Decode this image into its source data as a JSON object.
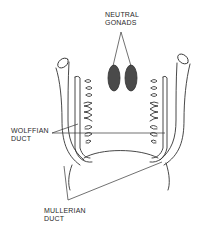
{
  "diagram": {
    "labels": {
      "neutral_gonads": {
        "line1": "NEUTRAL",
        "line2": "GONADS"
      },
      "wolffian_duct": {
        "line1": "WOLFFIAN",
        "line2": "DUCT"
      },
      "mullerian_duct": {
        "line1": "MULLERIAN",
        "line2": "DUCT"
      }
    },
    "colors": {
      "ink": "#333333",
      "gonad_fill": "#4a4a4a",
      "background": "#ffffff"
    }
  }
}
